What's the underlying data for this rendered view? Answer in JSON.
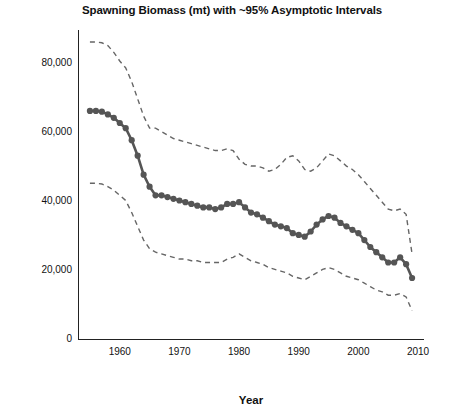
{
  "chart_data": {
    "type": "line",
    "title": "Spawning Biomass (mt) with ~95% Asymptotic Intervals",
    "xlabel": "Year",
    "ylabel": "Spawning Biomass (mt)",
    "xlim": [
      1953,
      2011
    ],
    "ylim": [
      0,
      90000
    ],
    "grid": false,
    "legend": "none",
    "xticks": [
      1960,
      1970,
      1980,
      1990,
      2000,
      2010
    ],
    "xtick_labels": [
      "1960",
      "1970",
      "1980",
      "1990",
      "2000",
      "2010"
    ],
    "yticks": [
      0,
      20000,
      40000,
      60000,
      80000
    ],
    "ytick_labels": [
      "0",
      "20,000",
      "40,000",
      "60,000",
      "80,000"
    ],
    "x": [
      1955,
      1956,
      1957,
      1958,
      1959,
      1960,
      1961,
      1962,
      1963,
      1964,
      1965,
      1966,
      1967,
      1968,
      1969,
      1970,
      1971,
      1972,
      1973,
      1974,
      1975,
      1976,
      1977,
      1978,
      1979,
      1980,
      1981,
      1982,
      1983,
      1984,
      1985,
      1986,
      1987,
      1988,
      1989,
      1990,
      1991,
      1992,
      1993,
      1994,
      1995,
      1996,
      1997,
      1998,
      1999,
      2000,
      2001,
      2002,
      2003,
      2004,
      2005,
      2006,
      2007,
      2008,
      2009
    ],
    "series": [
      {
        "name": "Spawning biomass",
        "style": "solid-with-markers",
        "color": "#555555",
        "values": [
          66500,
          66500,
          66300,
          65500,
          64500,
          63000,
          61500,
          58000,
          53500,
          48000,
          44500,
          42000,
          42000,
          41500,
          41000,
          40500,
          40000,
          39500,
          39000,
          38500,
          38500,
          38000,
          38500,
          39500,
          39500,
          40000,
          38500,
          37000,
          36500,
          35500,
          34500,
          33500,
          33000,
          32500,
          31000,
          30500,
          30000,
          31500,
          33500,
          35000,
          36000,
          35500,
          34000,
          33000,
          32000,
          31000,
          29000,
          27000,
          25500,
          24000,
          22500,
          22500,
          24000,
          22000,
          18000
        ]
      },
      {
        "name": "Upper ~95% asymptotic interval",
        "style": "dashed",
        "color": "#666666",
        "values": [
          86500,
          86500,
          86300,
          85500,
          83500,
          81000,
          79000,
          75000,
          70000,
          65000,
          61500,
          61500,
          60500,
          59500,
          58500,
          58000,
          57500,
          57000,
          56500,
          56000,
          55500,
          55000,
          55000,
          55500,
          55000,
          52500,
          51000,
          50500,
          50500,
          50000,
          49000,
          49500,
          51000,
          53000,
          53500,
          52000,
          49500,
          49000,
          50000,
          52000,
          54000,
          53500,
          52000,
          50500,
          49500,
          48000,
          46000,
          44000,
          42000,
          40000,
          38000,
          37500,
          38000,
          36500,
          25000
        ]
      },
      {
        "name": "Lower ~95% asymptotic interval",
        "style": "dashed",
        "color": "#666666",
        "values": [
          45500,
          45500,
          45300,
          44500,
          43500,
          42000,
          40500,
          37000,
          33000,
          29000,
          26500,
          25500,
          25000,
          24500,
          24000,
          23500,
          23500,
          23000,
          23000,
          22500,
          22500,
          22500,
          22500,
          23500,
          24000,
          25000,
          24000,
          23000,
          22500,
          22000,
          21000,
          20500,
          20000,
          19500,
          18500,
          18000,
          17500,
          18500,
          19500,
          20500,
          21000,
          20500,
          19500,
          18500,
          18000,
          17500,
          16500,
          15500,
          14500,
          14000,
          13000,
          13000,
          13500,
          12500,
          8500
        ]
      }
    ]
  }
}
